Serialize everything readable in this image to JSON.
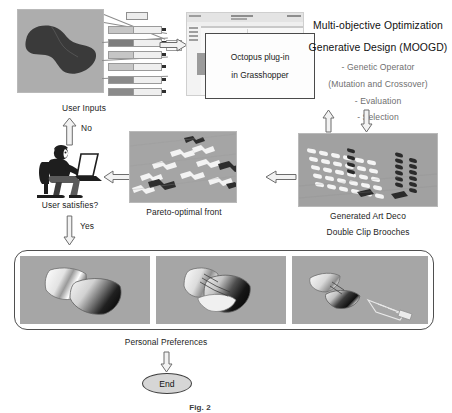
{
  "figure": {
    "domain": "flowchart-diagram",
    "caption": "Fig. 2",
    "background": "#ffffff"
  },
  "process": {
    "inputs": {
      "label": "User Inputs",
      "photo_alt": "dark double clip brooch model",
      "slider_panel_alt": "Grasshopper number slider stack"
    },
    "octopus": {
      "callout_line1": "Octopus plug-in",
      "callout_line2": "in Grasshopper",
      "screenshot_alt": "Octopus solver window"
    },
    "moogd": {
      "title_line1": "Multi-objective Optimization",
      "title_line2": "Generative Design (MOOGD)",
      "bullets": [
        "- Genetic Operator",
        "(Mutation and Crossover)",
        "- Evaluation",
        "- Selection"
      ]
    },
    "generated": {
      "label_line1": "Generated Art Deco",
      "label_line2": "Double Clip Brooches",
      "photo_alt": "perspective grid array of generated brooches"
    },
    "pareto": {
      "label": "Pareto-optimal front",
      "photo_alt": "scattered pareto optimal brooch solutions"
    },
    "decision": {
      "label": "User satisfies?",
      "no_label": "No",
      "yes_label": "Yes",
      "person_alt": "designer seated at laptop"
    },
    "results": {
      "panel_alt": "three rendered brooch results",
      "items": [
        {
          "alt": "two-piece polished clip brooch"
        },
        {
          "alt": "layered clip brooch with engraving"
        },
        {
          "alt": "clip brooch with detached clip mechanism"
        }
      ]
    },
    "preferences": {
      "label": "Personal Preferences"
    },
    "end": {
      "label": "End"
    }
  },
  "colors": {
    "photo_bg": "#a8a8a8",
    "arrow_fill": "#f2f2f2",
    "arrow_stroke": "#6d6d6d",
    "text": "#1c1c1c",
    "muted_text": "#6f6f6f",
    "panel_border": "#4f4f4f",
    "end_fill": "#d6d6d6"
  }
}
